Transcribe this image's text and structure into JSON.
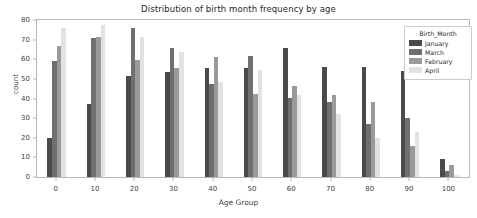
{
  "chart_data": {
    "type": "bar",
    "title": "Distribution of birth month frequency by age",
    "xlabel": "Age Group",
    "ylabel": "count",
    "categories": [
      "0",
      "10",
      "20",
      "30",
      "40",
      "50",
      "60",
      "70",
      "80",
      "90",
      "100"
    ],
    "ylim": [
      0,
      80
    ],
    "yticks": [
      "0",
      "10",
      "20",
      "30",
      "40",
      "50",
      "60",
      "70",
      "80"
    ],
    "grid": false,
    "legend_title": "Birth_Month",
    "legend_position": "upper right",
    "series": [
      {
        "name": "January",
        "color": "#4a4a4a",
        "values": [
          20,
          37,
          51.5,
          53.5,
          55.5,
          55.5,
          65.5,
          56,
          56,
          54,
          9
        ]
      },
      {
        "name": "March",
        "color": "#6f6f6f",
        "values": [
          59,
          71,
          76,
          65.5,
          47.5,
          61.5,
          40.5,
          38,
          27,
          30,
          3
        ]
      },
      {
        "name": "February",
        "color": "#9a9a9a",
        "values": [
          67,
          71.5,
          59.5,
          55.5,
          61,
          42.5,
          46.5,
          42,
          38,
          16,
          6
        ]
      },
      {
        "name": "April",
        "color": "#e2e2e2",
        "values": [
          76,
          77.5,
          71.5,
          63.5,
          48.5,
          54.5,
          42,
          32,
          20,
          23,
          1
        ]
      }
    ]
  }
}
